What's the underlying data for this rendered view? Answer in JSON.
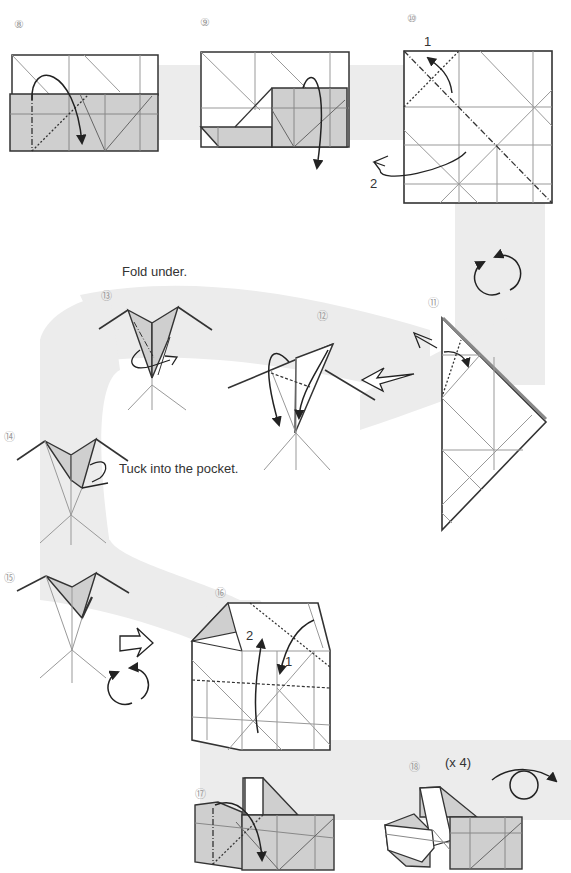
{
  "page": {
    "colors": {
      "band": "#ececec",
      "shade": "#cfcfcf",
      "line": "#333333",
      "crease": "#9a9a9a"
    }
  },
  "steps": [
    {
      "id": "step-8",
      "number": "8",
      "numeral": "⑧"
    },
    {
      "id": "step-9",
      "number": "9",
      "numeral": "⑨"
    },
    {
      "id": "step-10",
      "number": "10",
      "numeral": "⑩",
      "sub_labels": [
        "1",
        "2"
      ]
    },
    {
      "id": "step-11",
      "number": "11",
      "numeral": "⑪"
    },
    {
      "id": "step-12",
      "number": "12",
      "numeral": "⑫"
    },
    {
      "id": "step-13",
      "number": "13",
      "numeral": "⑬",
      "caption": "Fold under."
    },
    {
      "id": "step-14",
      "number": "14",
      "numeral": "⑭",
      "caption": "Tuck into the pocket."
    },
    {
      "id": "step-15",
      "number": "15",
      "numeral": "⑮"
    },
    {
      "id": "step-16",
      "number": "16",
      "numeral": "⑯",
      "sub_labels": [
        "1",
        "2"
      ]
    },
    {
      "id": "step-17",
      "number": "17",
      "numeral": "⑰"
    },
    {
      "id": "step-18",
      "number": "18",
      "numeral": "⑱",
      "caption": "(x 4)"
    }
  ],
  "symbols": [
    {
      "name": "turn-over-icon",
      "near": "step-11"
    },
    {
      "name": "turn-over-icon",
      "near": "step-15"
    },
    {
      "name": "rotate-icon",
      "near": "step-18"
    },
    {
      "name": "next-arrow-icon",
      "near": "step-12"
    },
    {
      "name": "next-arrow-icon",
      "near": "step-16"
    }
  ]
}
